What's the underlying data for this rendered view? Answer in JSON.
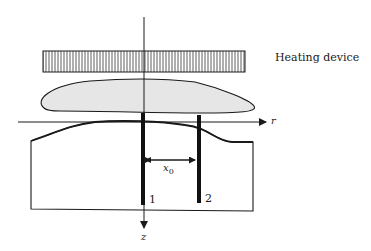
{
  "diagram": {
    "heater_label": "Heating device",
    "axis_r_label": "r",
    "axis_z_label": "z",
    "distance_label": "x",
    "distance_subscript": "0",
    "probe_1_label": "1",
    "probe_2_label": "2"
  },
  "colors": {
    "ink": "#1a1a1a",
    "flame_fill": "#e6e6e6"
  }
}
